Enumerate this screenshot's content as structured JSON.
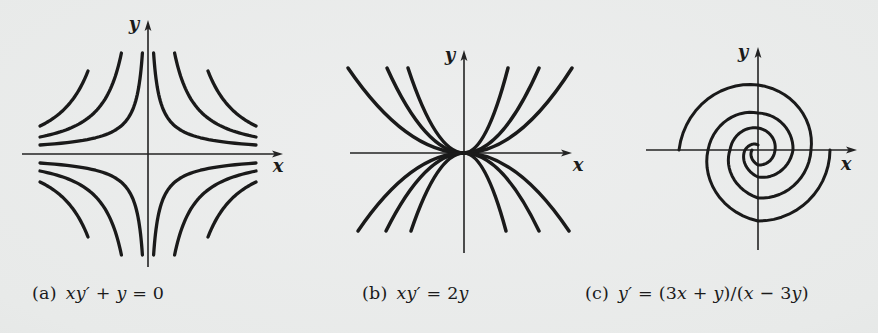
{
  "page": {
    "background": "#e8eae9",
    "ink": "#1a1a1a",
    "axis_ink": "#232323"
  },
  "chart_data": [
    {
      "type": "line",
      "panel": "a",
      "caption_text": "(a) xy′ + y = 0",
      "equation": "xy' + y = 0",
      "solution_family": "hyperbola-like curves xy = c, mirrored in all four quadrants",
      "curves_per_quadrant": 3,
      "axes": {
        "ticks": "none",
        "grid": false,
        "x_label": "x",
        "y_label": "y"
      },
      "branches": [
        {
          "x_top": 5.6,
          "y_top": 101,
          "x_side": 108,
          "y_side": 9
        },
        {
          "x_top": 26.6,
          "y_top": 101,
          "x_side": 108,
          "y_side": 17
        },
        {
          "x_top": 60,
          "y_top": 83,
          "x_side": 108,
          "y_side": 28
        }
      ]
    },
    {
      "type": "line",
      "panel": "b",
      "caption_text": "(b) xy′ = 2y",
      "equation": "xy' = 2y",
      "solution_family": "parabolas y = cx² opening up and down, tangent to the x-axis at the origin",
      "curve_count": 6,
      "axes": {
        "ticks": "none",
        "grid": false,
        "x_label": "x",
        "y_label": "y"
      },
      "quadrants": [
        {
          "sx": -1,
          "sy": 1,
          "tip_y": 85,
          "x_ends": [
            56,
            77,
            116
          ]
        },
        {
          "sx": 1,
          "sy": 1,
          "tip_y": 85,
          "x_ends": [
            44,
            75,
            108
          ]
        },
        {
          "sx": -1,
          "sy": -1,
          "tip_y": 78,
          "x_ends": [
            53,
            78,
            106
          ]
        },
        {
          "sx": 1,
          "sy": -1,
          "tip_y": 78,
          "x_ends": [
            42,
            75,
            105
          ]
        }
      ]
    },
    {
      "type": "line",
      "panel": "c",
      "caption_text": "(c) y′ = (3x + y)/(x − 3y)",
      "equation": "y' = (3x + y)/(x - 3y)",
      "solution_family": "logarithmic spirals winding into the origin; outer ends terminate on the x-axis",
      "arm_count": 2,
      "axes": {
        "ticks": "none",
        "grid": false,
        "x_label": "x",
        "y_label": "y"
      },
      "arms": [
        {
          "start_deg": 180,
          "radii": [
            79,
            65,
            53,
            48,
            28,
            22,
            17,
            15,
            6
          ]
        },
        {
          "start_deg": 0,
          "radii": [
            72,
            71,
            50,
            37,
            35,
            27,
            13,
            5
          ]
        }
      ]
    }
  ],
  "panels": [
    {
      "key": "a",
      "caption": {
        "x": 32,
        "y": 283,
        "runs": [
          {
            "t": "(a) ",
            "i": 0
          },
          {
            "t": "xy′",
            "i": 1
          },
          {
            "t": " + ",
            "i": 0
          },
          {
            "t": "y",
            "i": 1
          },
          {
            "t": " = 0",
            "i": 0
          }
        ]
      },
      "axis": {
        "x_label": "x",
        "y_label": "y",
        "ox": 148,
        "oy": 154,
        "x_neg": 126,
        "x_pos": 135,
        "y_up": 134,
        "y_dn": 113,
        "x_label_pos": [
          278,
          167
        ],
        "y_label_pos": [
          134,
          25
        ]
      },
      "stroke_width": 3.3
    },
    {
      "key": "b",
      "caption": {
        "x": 362,
        "y": 283,
        "runs": [
          {
            "t": "(b) ",
            "i": 0
          },
          {
            "t": "xy′",
            "i": 1
          },
          {
            "t": " = 2",
            "i": 0
          },
          {
            "t": "y",
            "i": 1
          }
        ]
      },
      "axis": {
        "x_label": "x",
        "y_label": "y",
        "ox": 464,
        "oy": 153,
        "x_neg": 114,
        "x_pos": 108,
        "y_up": 103,
        "y_dn": 100,
        "x_label_pos": [
          578,
          166
        ],
        "y_label_pos": [
          450,
          56
        ]
      },
      "stroke_width": 3.5
    },
    {
      "key": "c",
      "caption": {
        "x": 585,
        "y": 283,
        "runs": [
          {
            "t": "(c) ",
            "i": 0
          },
          {
            "t": "y′",
            "i": 1
          },
          {
            "t": " = (3",
            "i": 0
          },
          {
            "t": "x",
            "i": 1
          },
          {
            "t": " + ",
            "i": 0
          },
          {
            "t": "y",
            "i": 1
          },
          {
            "t": ")/(",
            "i": 0
          },
          {
            "t": "x",
            "i": 1
          },
          {
            "t": " − 3",
            "i": 0
          },
          {
            "t": "y",
            "i": 1
          },
          {
            "t": ")",
            "i": 0
          }
        ]
      },
      "axis": {
        "x_label": "x",
        "y_label": "y",
        "ox": 758,
        "oy": 150,
        "x_neg": 112,
        "x_pos": 99,
        "y_up": 103,
        "y_dn": 100,
        "x_label_pos": [
          846,
          165
        ],
        "y_label_pos": [
          743,
          53
        ]
      },
      "stroke_width": 3.0
    }
  ]
}
